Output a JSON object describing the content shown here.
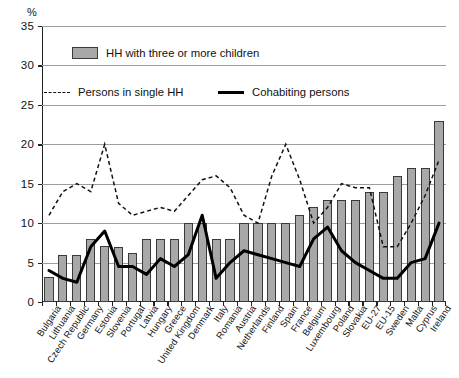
{
  "axis": {
    "unit_label": "%",
    "y_ticks": [
      0,
      5,
      10,
      15,
      20,
      25,
      30,
      35
    ],
    "ylim": [
      0,
      35
    ]
  },
  "legend": {
    "bar_label": "HH with three or more children",
    "dashed_label": "Persons in single HH",
    "solid_label": "Cohabiting persons"
  },
  "colors": {
    "bar_fill": "#a8a8a8",
    "bar_stroke": "#3a3a3a",
    "dashed_line": "#111111",
    "solid_line": "#000000",
    "grid": "#9d9d9d",
    "axis": "#222222"
  },
  "chart_data": {
    "type": "bar",
    "title": "",
    "subtitle": "",
    "xlabel": "",
    "ylabel": "%",
    "ylim": [
      0,
      35
    ],
    "yticks": [
      0,
      5,
      10,
      15,
      20,
      25,
      30,
      35
    ],
    "grid": true,
    "legend_position": "top-left",
    "categories": [
      "Bulgaria",
      "Lithuania",
      "Czech Republic",
      "Germany",
      "Estonia",
      "Slovenia",
      "Portugal",
      "Latvia",
      "Hungary",
      "Greece",
      "United Kingdom",
      "Denmark",
      "Italy",
      "Romania",
      "Austria",
      "Netherlands",
      "Finland",
      "Spain",
      "France",
      "Belgium",
      "Luxembourg",
      "Poland",
      "Slovakia",
      "EU-27",
      "EU-15",
      "Sweden",
      "Malta",
      "Cyprus",
      "Ireland"
    ],
    "series": [
      {
        "name": "HH with three or more children",
        "type": "bar",
        "values": [
          3.2,
          6.0,
          6.0,
          8.0,
          7.1,
          7.0,
          6.2,
          8.0,
          8.0,
          8.0,
          10.0,
          10.0,
          8.0,
          8.0,
          10.0,
          10.0,
          10.0,
          10.0,
          11.0,
          12.0,
          13.0,
          13.0,
          13.0,
          14.0,
          14.0,
          16.0,
          17.0,
          17.0,
          23.0
        ]
      },
      {
        "name": "Persons in single HH",
        "type": "line",
        "style": "dashed",
        "values": [
          11.0,
          14.0,
          15.0,
          14.0,
          20.0,
          12.5,
          11.0,
          11.5,
          12.0,
          11.5,
          13.5,
          15.5,
          16.0,
          14.5,
          11.0,
          10.0,
          16.0,
          20.0,
          15.5,
          10.0,
          12.0,
          15.0,
          14.5,
          14.5,
          7.0,
          7.0,
          10.0,
          13.5,
          18.0
        ]
      },
      {
        "name": "Cohabiting persons",
        "type": "line",
        "style": "solid",
        "values": [
          4.0,
          3.0,
          2.5,
          7.0,
          9.0,
          4.5,
          4.5,
          3.5,
          5.5,
          4.5,
          6.0,
          11.0,
          3.0,
          5.0,
          6.5,
          6.0,
          5.5,
          5.0,
          4.5,
          8.0,
          9.5,
          6.5,
          5.0,
          4.0,
          3.0,
          3.0,
          5.0,
          5.5,
          10.0
        ]
      }
    ],
    "series_note": "Third series continues: values beyond index 28 not applicable"
  },
  "cohabiting_full": [
    4.0,
    3.0,
    2.5,
    7.0,
    9.0,
    4.5,
    4.5,
    3.5,
    5.5,
    4.5,
    6.0,
    11.0,
    3.0,
    5.0,
    6.5,
    6.0,
    5.5,
    5.0,
    4.5,
    8.0,
    9.5,
    6.5,
    5.0,
    4.0,
    3.0,
    3.0,
    5.0,
    5.5,
    10.0
  ],
  "dashed_full": [
    11.0,
    14.0,
    15.0,
    14.0,
    20.0,
    12.5,
    11.0,
    11.5,
    12.0,
    11.5,
    13.5,
    15.5,
    16.0,
    14.5,
    11.0,
    10.0,
    16.0,
    20.0,
    15.5,
    10.0,
    12.0,
    15.0,
    14.5,
    14.5,
    7.0,
    7.0,
    10.0,
    13.5,
    18.0
  ]
}
